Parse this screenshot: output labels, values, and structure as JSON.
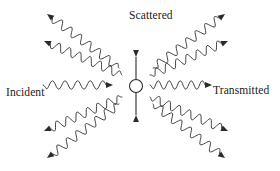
{
  "figure": {
    "background_color": "#ffffff",
    "stroke_color": "#2b2b2b",
    "text_color": "#1a1a1a",
    "width": 280,
    "height": 171
  },
  "labels": {
    "incident": "Incident",
    "transmitted": "Transmitted",
    "scattered": "Scattered"
  },
  "scatterer": {
    "name": "oscillating-scatterer",
    "shape": "circle",
    "center_x": 136,
    "center_y": 86,
    "radius": 6.5,
    "oscillation_axis": "vertical",
    "arrow_top_y": 57,
    "arrow_bottom_y": 115,
    "arrow_heads": 2
  },
  "waves": [
    {
      "id": "incident-wave",
      "role": "incident",
      "angle_deg": 0,
      "direction": "rightward",
      "x1": 43,
      "y1": 85,
      "x2": 113,
      "y2": 85,
      "cycles": 5,
      "amplitude": 4.2,
      "arrowhead": "end"
    },
    {
      "id": "transmitted-wave",
      "role": "transmitted",
      "angle_deg": 0,
      "direction": "rightward",
      "x1": 150,
      "y1": 85,
      "x2": 212,
      "y2": 85,
      "cycles": 5,
      "amplitude": 4.2,
      "arrowhead": "end"
    },
    {
      "id": "scattered-wave-upper-left-steep",
      "role": "scattered",
      "quadrant": "upper-left",
      "angle_deg": 130,
      "direction": "outward",
      "x1": 119,
      "y1": 68,
      "x2": 47,
      "y2": 14,
      "cycles": 7,
      "amplitude": 4.2,
      "arrowhead": "end"
    },
    {
      "id": "scattered-wave-upper-left-shallow",
      "role": "scattered",
      "quadrant": "upper-left",
      "angle_deg": 155,
      "direction": "outward",
      "x1": 122,
      "y1": 75,
      "x2": 44,
      "y2": 41,
      "cycles": 7,
      "amplitude": 4.2,
      "arrowhead": "end"
    },
    {
      "id": "scattered-wave-upper-right-steep",
      "role": "scattered",
      "quadrant": "upper-right",
      "angle_deg": 50,
      "direction": "outward",
      "x1": 153,
      "y1": 68,
      "x2": 225,
      "y2": 14,
      "cycles": 7,
      "amplitude": 4.2,
      "arrowhead": "end"
    },
    {
      "id": "scattered-wave-upper-right-shallow",
      "role": "scattered",
      "quadrant": "upper-right",
      "angle_deg": 25,
      "direction": "outward",
      "x1": 150,
      "y1": 75,
      "x2": 228,
      "y2": 41,
      "cycles": 7,
      "amplitude": 4.2,
      "arrowhead": "end"
    },
    {
      "id": "scattered-wave-lower-left-shallow",
      "role": "scattered",
      "quadrant": "lower-left",
      "angle_deg": 205,
      "direction": "outward",
      "x1": 122,
      "y1": 97,
      "x2": 44,
      "y2": 131,
      "cycles": 7,
      "amplitude": 4.2,
      "arrowhead": "end"
    },
    {
      "id": "scattered-wave-lower-left-steep",
      "role": "scattered",
      "quadrant": "lower-left",
      "angle_deg": 230,
      "direction": "outward",
      "x1": 119,
      "y1": 104,
      "x2": 47,
      "y2": 158,
      "cycles": 7,
      "amplitude": 4.2,
      "arrowhead": "end"
    },
    {
      "id": "scattered-wave-lower-right-shallow",
      "role": "scattered",
      "quadrant": "lower-right",
      "angle_deg": 335,
      "direction": "outward",
      "x1": 150,
      "y1": 97,
      "x2": 228,
      "y2": 131,
      "cycles": 7,
      "amplitude": 4.2,
      "arrowhead": "end"
    },
    {
      "id": "scattered-wave-lower-right-steep",
      "role": "scattered",
      "quadrant": "lower-right",
      "angle_deg": 310,
      "direction": "outward",
      "x1": 153,
      "y1": 104,
      "x2": 225,
      "y2": 158,
      "cycles": 7,
      "amplitude": 4.2,
      "arrowhead": "end"
    }
  ]
}
